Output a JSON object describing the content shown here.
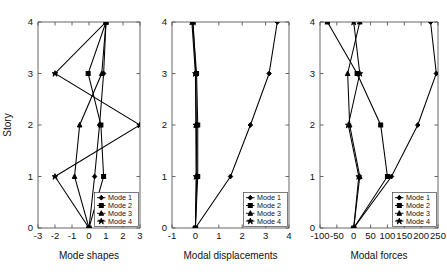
{
  "figure": {
    "ylabel": "Story",
    "legend_entries": [
      "Mode 1",
      "Mode 2",
      "Mode 3",
      "Mode 4"
    ],
    "series_color": "#000000",
    "axis_color": "#555555",
    "background": "#ffffff"
  },
  "chart_data": [
    {
      "type": "line",
      "title": "",
      "xlabel": "Mode shapes",
      "ylabel": "Story",
      "xlim": [
        -3,
        3
      ],
      "ylim": [
        0,
        4
      ],
      "xticks": [
        -3,
        -2,
        -1,
        0,
        1,
        2,
        3
      ],
      "yticks": [
        0,
        1,
        2,
        3,
        4
      ],
      "xticklabels": [
        "-3",
        "-2",
        "-1",
        "0",
        "1",
        "2",
        "3"
      ],
      "yticklabels": [
        "0",
        "1",
        "2",
        "3",
        "4"
      ],
      "grid": false,
      "legend_position": "lower right",
      "orientation": "y-is-story",
      "y": [
        0,
        1,
        2,
        3,
        4
      ],
      "series": [
        {
          "name": "Mode 1",
          "values": [
            0,
            0.33,
            0.62,
            0.86,
            1.0
          ],
          "marker": "diamond"
        },
        {
          "name": "Mode 2",
          "values": [
            0,
            0.86,
            0.7,
            -0.05,
            1.0
          ],
          "marker": "square"
        },
        {
          "name": "Mode 3",
          "values": [
            0,
            -0.85,
            -0.55,
            0.75,
            1.0
          ],
          "marker": "triangle"
        },
        {
          "name": "Mode 4",
          "values": [
            0,
            -2.0,
            3.0,
            -2.0,
            1.0
          ],
          "marker": "star"
        }
      ]
    },
    {
      "type": "line",
      "title": "",
      "xlabel": "Modal displacements",
      "ylabel": "Story",
      "xlim": [
        -1,
        4
      ],
      "ylim": [
        0,
        4
      ],
      "xticks": [
        -1,
        0,
        1,
        2,
        3,
        4
      ],
      "yticks": [
        0,
        1,
        2,
        3,
        4
      ],
      "xticklabels": [
        "-1",
        "0",
        "1",
        "2",
        "3",
        "4"
      ],
      "yticklabels": [
        "0",
        "1",
        "2",
        "3",
        "4"
      ],
      "grid": false,
      "legend_position": "lower right",
      "orientation": "y-is-story",
      "y": [
        0,
        1,
        2,
        3,
        4
      ],
      "series": [
        {
          "name": "Mode 1",
          "values": [
            0,
            1.5,
            2.35,
            3.15,
            3.5
          ],
          "marker": "diamond"
        },
        {
          "name": "Mode 2",
          "values": [
            0,
            0.1,
            0.1,
            0.05,
            -0.12
          ],
          "marker": "square"
        },
        {
          "name": "Mode 3",
          "values": [
            0,
            0.06,
            0.04,
            0.02,
            -0.1
          ],
          "marker": "triangle"
        },
        {
          "name": "Mode 4",
          "values": [
            0,
            0.03,
            0.02,
            0.0,
            -0.15
          ],
          "marker": "star"
        }
      ]
    },
    {
      "type": "line",
      "title": "",
      "xlabel": "Modal forces",
      "ylabel": "Story",
      "xlim": [
        -100,
        250
      ],
      "ylim": [
        0,
        4
      ],
      "xticks": [
        -100,
        -50,
        0,
        50,
        100,
        150,
        200,
        250
      ],
      "yticks": [
        0,
        1,
        2,
        3,
        4
      ],
      "xticklabels": [
        "-100",
        "-50",
        "0",
        "50",
        "100",
        "150",
        "200",
        "250"
      ],
      "yticklabels": [
        "0",
        "1",
        "2",
        "3",
        "4"
      ],
      "grid": false,
      "legend_position": "lower right",
      "orientation": "y-is-story",
      "y": [
        0,
        1,
        2,
        3,
        4
      ],
      "series": [
        {
          "name": "Mode 1",
          "values": [
            0,
            112,
            190,
            245,
            228
          ],
          "marker": "diamond"
        },
        {
          "name": "Mode 2",
          "values": [
            0,
            100,
            80,
            10,
            -78
          ],
          "marker": "square"
        },
        {
          "name": "Mode 3",
          "values": [
            0,
            18,
            -12,
            -18,
            18
          ],
          "marker": "triangle"
        },
        {
          "name": "Mode 4",
          "values": [
            0,
            15,
            -16,
            18,
            0
          ],
          "marker": "star"
        }
      ]
    }
  ]
}
